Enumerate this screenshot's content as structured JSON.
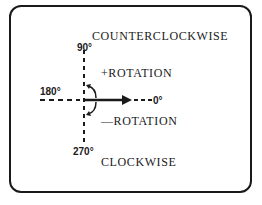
{
  "diagram": {
    "labels": {
      "counterclockwise": "COUNTERCLOCKWISE",
      "clockwise": "CLOCKWISE",
      "positive_rotation": "+ROTATION",
      "negative_rotation": "—ROTATION",
      "angle_90": "90°",
      "angle_180": "180°",
      "angle_0": "0°",
      "angle_270": "270°"
    },
    "colors": {
      "ink": "#1a1a1a",
      "background": "#ffffff"
    }
  }
}
